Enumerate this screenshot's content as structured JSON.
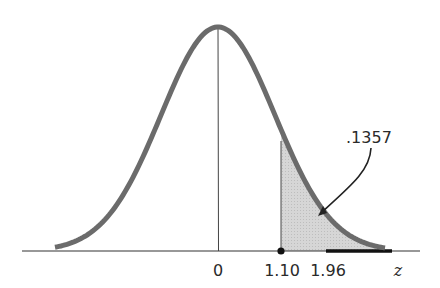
{
  "chart_data": {
    "type": "area",
    "title": "",
    "xlabel": "z",
    "ylabel": "",
    "tick_labels": [
      "0",
      "1.10",
      "1.96"
    ],
    "ticks": [
      0,
      1.1,
      1.96
    ],
    "shaded_region": {
      "from": 1.1,
      "to": "inf",
      "area": 0.1357
    },
    "highlighted_interval": {
      "from": 1.96,
      "to": "inf"
    },
    "annotations": [
      {
        "text": ".1357",
        "points_to": "shaded area"
      }
    ],
    "mean": 0,
    "grid": false,
    "legend": null
  },
  "labels": {
    "zero": "0",
    "z110": "1.10",
    "z196": "1.96",
    "axis_var": "z",
    "area": ".1357"
  },
  "colors": {
    "curve": "#6b6b6b",
    "shade": "#d9d9d9",
    "axis": "#333333",
    "ink": "#222222"
  }
}
